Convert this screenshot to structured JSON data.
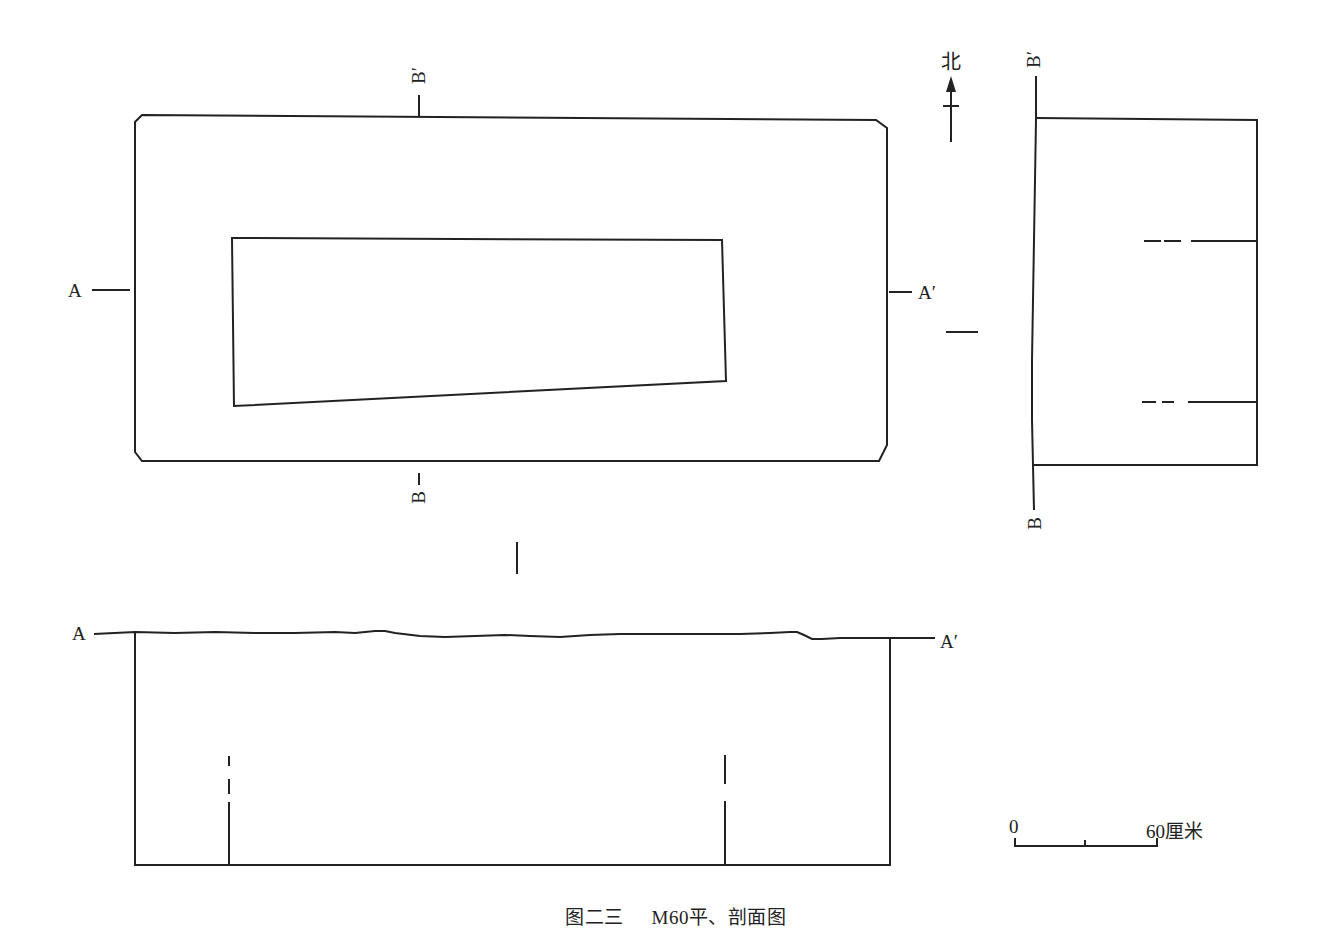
{
  "figure": {
    "caption_number": "图二三",
    "caption_title": "M60平、剖面图"
  },
  "north_arrow": {
    "label": "北"
  },
  "plan_view": {
    "section_labels": {
      "a_left": "A",
      "a_right": "A′",
      "b_top": "B′",
      "b_bottom": "B"
    }
  },
  "section_b": {
    "labels": {
      "top": "B′",
      "bottom": "B"
    }
  },
  "section_a": {
    "labels": {
      "left": "A",
      "right": "A′"
    }
  },
  "scale_bar": {
    "start_label": "0",
    "end_label": "60厘米"
  }
}
